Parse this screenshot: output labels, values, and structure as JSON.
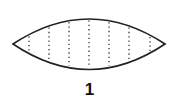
{
  "figure": {
    "label": "1",
    "shape": "lens",
    "outline_color": "#222222",
    "dot_color": "#333333",
    "lens": {
      "left_x": 13,
      "right_x": 165,
      "center_y": 44,
      "top_y": 19,
      "bottom_y": 70
    },
    "dotted_lines_x": [
      29,
      49,
      69,
      89,
      109,
      129,
      150
    ]
  }
}
